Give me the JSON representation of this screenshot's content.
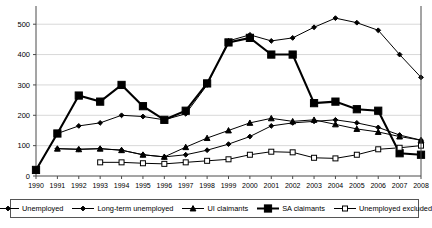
{
  "chart_data": {
    "type": "line",
    "title": "",
    "xlabel": "",
    "ylabel": "",
    "x": [
      1990,
      1991,
      1992,
      1993,
      1994,
      1995,
      1996,
      1997,
      1998,
      1999,
      2000,
      2001,
      2002,
      2003,
      2004,
      2005,
      2006,
      2007,
      2008
    ],
    "xtick_labels": [
      "1990",
      "1991",
      "1992",
      "1993",
      "1994",
      "1995",
      "1996",
      "1997",
      "1998",
      "1999",
      "2000",
      "2001",
      "2002",
      "2003",
      "2004",
      "2005",
      "2006",
      "2007",
      "2008"
    ],
    "ytick_labels": [
      "0",
      "100",
      "200",
      "300",
      "400",
      "500"
    ],
    "yticks": [
      0,
      100,
      200,
      300,
      400,
      500
    ],
    "ylim": [
      0,
      560
    ],
    "xlim": [
      1990,
      2008
    ],
    "grid": "horizontal",
    "legend_position": "bottom",
    "series": [
      {
        "name": "Unemployed",
        "marker": "diamond",
        "line_width": "thin",
        "values": [
          20,
          140,
          165,
          175,
          200,
          196,
          185,
          205,
          300,
          445,
          465,
          445,
          455,
          490,
          520,
          505,
          480,
          400,
          325
        ]
      },
      {
        "name": "Long-term unemployed",
        "marker": "diamond",
        "line_width": "thin",
        "values": [
          null,
          90,
          88,
          90,
          85,
          70,
          63,
          70,
          85,
          105,
          130,
          165,
          175,
          180,
          185,
          175,
          160,
          135,
          118
        ]
      },
      {
        "name": "UI claimants",
        "marker": "triangle",
        "line_width": "thin",
        "values": [
          null,
          90,
          88,
          90,
          85,
          70,
          63,
          95,
          125,
          150,
          175,
          190,
          180,
          185,
          170,
          155,
          145,
          130,
          118
        ]
      },
      {
        "name": "SA claimants",
        "marker": "square-filled",
        "line_width": "thick",
        "values": [
          20,
          140,
          265,
          245,
          300,
          230,
          185,
          215,
          305,
          440,
          455,
          400,
          400,
          240,
          245,
          220,
          215,
          75,
          70
        ]
      },
      {
        "name": "Unemployed excluded",
        "marker": "square-open",
        "line_width": "thin",
        "values": [
          null,
          null,
          null,
          45,
          45,
          42,
          40,
          45,
          50,
          55,
          70,
          80,
          78,
          60,
          58,
          70,
          88,
          93,
          100
        ]
      }
    ]
  },
  "legend": {
    "items": [
      {
        "label": "Unemployed",
        "marker": "diamond"
      },
      {
        "label": "Long-term unemployed",
        "marker": "diamond"
      },
      {
        "label": "UI claimants",
        "marker": "triangle"
      },
      {
        "label": "SA claimants",
        "marker": "square-filled"
      },
      {
        "label": "Unemployed excluded",
        "marker": "square-open"
      }
    ]
  },
  "colors": {
    "line": "#000000",
    "grid": "#d8d8d8",
    "axis": "#4a4a4a",
    "background": "#ffffff"
  }
}
